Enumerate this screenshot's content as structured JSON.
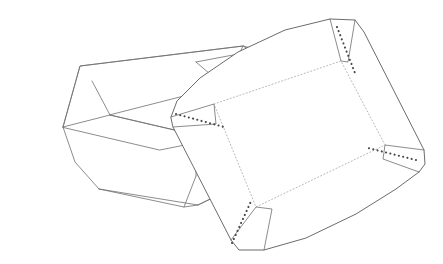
{
  "document": {
    "title": "Folding Tray — Assembled View and Die-Cut Blank",
    "figure_type": "technical line drawing",
    "background_color": "#ffffff",
    "line_color": "#6e6e72",
    "crease_color": "#9a9a9e",
    "dot_color": "#4a4a4e",
    "canvas": {
      "width": 443,
      "height": 264
    }
  },
  "objects": {
    "assembled_tray": {
      "name": "assembled-tray",
      "label": "Assembled open tray, three-quarter view",
      "line_style": "solid",
      "geometry": {
        "rim_top_back": "M 63,127 L 80,66 L 243,46 L 283,56 L 332,99 L 249,68",
        "rim_outline": "M 63,127 L 80,66 L 243,46 L 332,99 L 290,124 L 160,150 Z",
        "rim_inner": "M 63,127 L 160,150 L 290,124 L 332,99",
        "inner_floor": "M 110,115 L 196,135 L 280,114 L 224,86 Z",
        "corner_fold_left": "M 63,127 L 110,115 L 92,81",
        "corner_fold_back": "M 224,86 L 243,46 M 224,86 L 196,62",
        "corner_fold_back_edge": "M 196,62 L 249,52",
        "corner_fold_right": "M 280,114 L 332,99 M 280,114 L 297,75",
        "wall_front_left": "M 63,127 L 75,162 L 99,189",
        "wall_front": "M 99,189 L 184,207 L 198,205",
        "wall_front_right": "M 184,207 L 196,176 M 198,205 L 290,160 L 290,124",
        "wall_left_bottom": "M 75,162 L 99,189",
        "bottom_front_edge": "M 99,189 L 198,205 L 290,160",
        "left_outer_edge": "M 63,127 L 75,162",
        "right_outer_edge": "M 332,99 L 290,124",
        "flap_left": "M 92,81 L 110,115 L 63,127",
        "flap_right": "M 297,75 L 280,114 L 332,99",
        "floor_to_wall_left": "M 110,115 L 99,189",
        "floor_to_wall_front": "M 110,115 L 196,135 L 196,176",
        "floor_to_wall_right": "M 196,135 L 280,114 L 290,160"
      }
    },
    "die_cut_blank": {
      "name": "die-cut-blank",
      "label": "Unfolded die-cut blank with fold creases and corner gussets",
      "line_style": "solid outline with dotted fold creases",
      "geometry": {
        "outer_boundary": "M 171,117 L 177,101 L 200,78 L 238,52 L 285,30 L 330,19 L 355,20 L 364,32 L 424,150 L 425,164 L 419,172 L 396,189 L 356,214 L 306,238 L 264,250 L 239,250 L 231,240 L 173,127 Z",
        "crease_inner_rect": "M 214,104 L 341,61 L 385,145 L 256,207 Z",
        "crease_left_panel": "M 171,117 L 214,104 M 173,127 L 216,124",
        "crease_top_panel": "M 330,19 L 341,61 M 355,20 L 348,62",
        "crease_right_panel": "M 424,150 L 385,145 M 419,172 L 383,159",
        "crease_bottom_panel": "M 239,250 L 256,207 M 264,250 L 272,209",
        "top_edge_upper": "M 177,101 L 330,19",
        "top_edge_lower_crease": "M 214,104 L 341,61",
        "left_edge": "M 171,117 L 231,240",
        "bottom_edge": "M 239,250 L 396,189",
        "right_edge": "M 364,32 L 424,150",
        "gusset_top_right": "M 337,27 L 355,73",
        "gusset_left": "M 176,114 L 224,127",
        "gusset_bottom_left": "M 232,243 L 252,199",
        "gusset_right": "M 416,160 L 368,148",
        "corner_tab_top_right": "M 330,19 L 341,61 L 348,62 L 355,20",
        "corner_tab_left": "M 171,117 L 214,104 L 216,124 L 173,127",
        "corner_tab_bottom_left": "M 231,240 L 256,207 L 272,209 L 264,250",
        "corner_tab_right": "M 424,150 L 385,145 L 383,159 L 419,172"
      },
      "features": {
        "fold_lines": "dotted",
        "corner_gussets": 4,
        "gusset_style": "dotted diagonal",
        "panels": [
          "floor",
          "top-wall",
          "left-wall",
          "right-wall",
          "bottom-wall"
        ]
      }
    }
  }
}
